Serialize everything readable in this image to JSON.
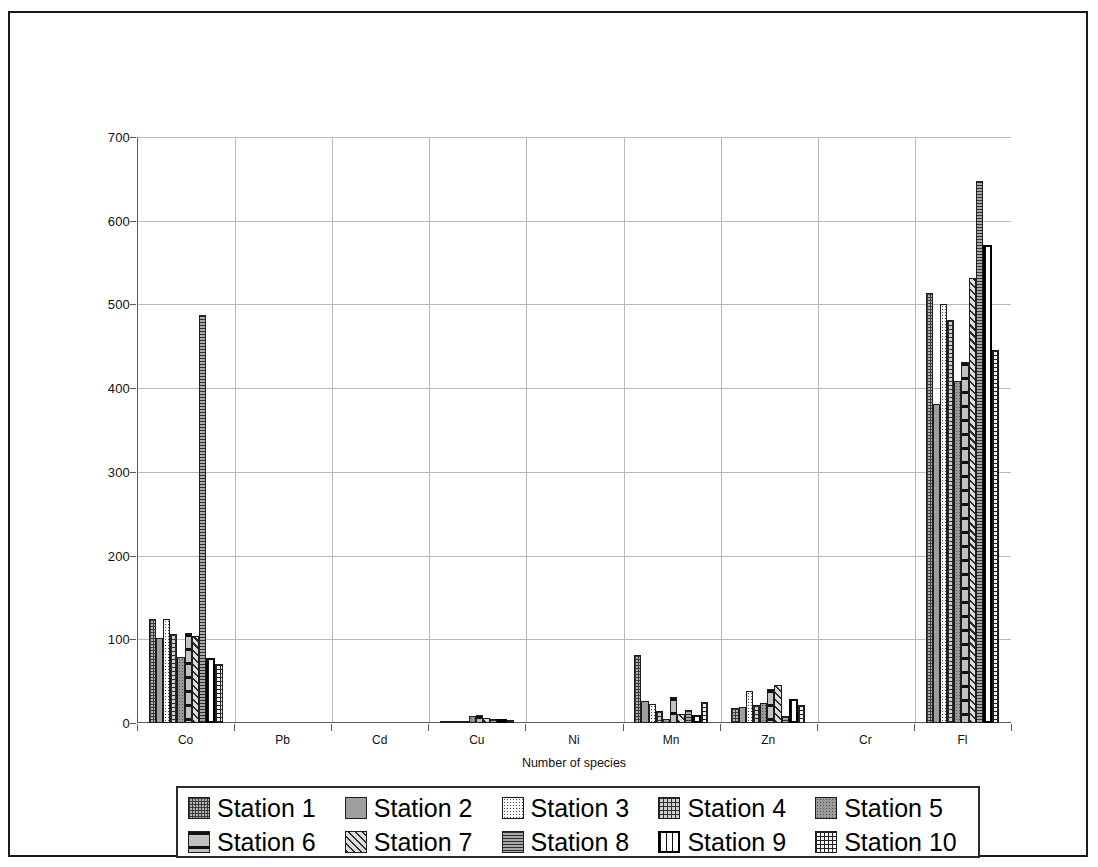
{
  "chart_data": {
    "type": "bar",
    "title": "",
    "xlabel": "Number of species",
    "ylabel": "mg/kg of body weight",
    "ylim": [
      0,
      700
    ],
    "yticks": [
      0,
      100,
      200,
      300,
      400,
      500,
      600,
      700
    ],
    "grid": true,
    "legend_position": "bottom",
    "categories": [
      "Co",
      "Pb",
      "Cd",
      "Cu",
      "Ni",
      "Mn",
      "Zn",
      "Cr",
      "Fl"
    ],
    "series": [
      {
        "name": "Station 1",
        "pattern": "p1",
        "values": [
          124,
          0,
          0,
          3,
          0,
          81,
          18,
          0,
          514
        ]
      },
      {
        "name": "Station 2",
        "pattern": "p2",
        "values": [
          101,
          0,
          0,
          3,
          0,
          26,
          19,
          0,
          381
        ]
      },
      {
        "name": "Station 3",
        "pattern": "p3",
        "values": [
          124,
          0,
          0,
          2,
          0,
          23,
          38,
          0,
          501
        ]
      },
      {
        "name": "Station 4",
        "pattern": "p4",
        "values": [
          106,
          0,
          0,
          2,
          0,
          14,
          21,
          0,
          481
        ]
      },
      {
        "name": "Station 5",
        "pattern": "p5",
        "values": [
          79,
          0,
          0,
          8,
          0,
          5,
          24,
          0,
          409
        ]
      },
      {
        "name": "Station 6",
        "pattern": "p6",
        "values": [
          107,
          0,
          0,
          9,
          0,
          31,
          41,
          0,
          431
        ]
      },
      {
        "name": "Station 7",
        "pattern": "p7",
        "values": [
          104,
          0,
          0,
          6,
          0,
          11,
          46,
          0,
          531
        ]
      },
      {
        "name": "Station 8",
        "pattern": "p8",
        "values": [
          487,
          0,
          0,
          5,
          0,
          16,
          8,
          0,
          647
        ]
      },
      {
        "name": "Station 9",
        "pattern": "p9",
        "values": [
          78,
          0,
          0,
          4,
          0,
          9,
          29,
          0,
          571
        ]
      },
      {
        "name": "Station 10",
        "pattern": "p10",
        "values": [
          70,
          0,
          0,
          4,
          0,
          25,
          22,
          0,
          446
        ]
      }
    ]
  },
  "axes": {
    "y_label": "mg/kg of body weight",
    "x_label": "Number of species",
    "y_ticks": [
      "700",
      "600",
      "500",
      "400",
      "300",
      "200",
      "100",
      "0"
    ],
    "x_ticks": [
      "Co",
      "Pb",
      "Cd",
      "Cu",
      "Ni",
      "Mn",
      "Zn",
      "Cr",
      "Fl"
    ]
  },
  "legend": {
    "rows": [
      [
        {
          "label": "Station 1",
          "pattern": "p1"
        },
        {
          "label": "Station 2",
          "pattern": "p2"
        },
        {
          "label": "Station 3",
          "pattern": "p3"
        },
        {
          "label": "Station 4",
          "pattern": "p4"
        },
        {
          "label": "Station 5",
          "pattern": "p5"
        }
      ],
      [
        {
          "label": "Station 6",
          "pattern": "p6"
        },
        {
          "label": "Station 7",
          "pattern": "p7"
        },
        {
          "label": "Station 8",
          "pattern": "p8"
        },
        {
          "label": "Station 9",
          "pattern": "p9"
        },
        {
          "label": "Station 10",
          "pattern": "p10"
        }
      ]
    ]
  },
  "colors": {
    "background": "#ffffff",
    "border": "#1a1a1a",
    "gridline": "#b9b9b9",
    "axis": "#5a5a5a",
    "text": "#111111"
  }
}
